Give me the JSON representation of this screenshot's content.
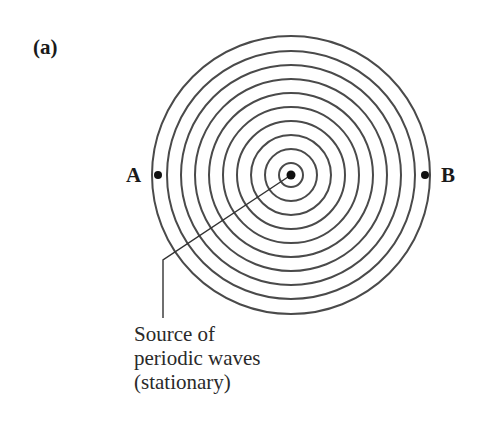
{
  "figure": {
    "panel_label": "(a)",
    "point_a_label": "A",
    "point_b_label": "B",
    "caption_lines": [
      "Source of",
      "periodic waves",
      "(stationary)"
    ],
    "ring_count": 10,
    "colors": {
      "ring_stroke": "#4a4a4a",
      "dot_fill": "#111111",
      "text": "#1a1a1a",
      "background": "#ffffff"
    }
  }
}
